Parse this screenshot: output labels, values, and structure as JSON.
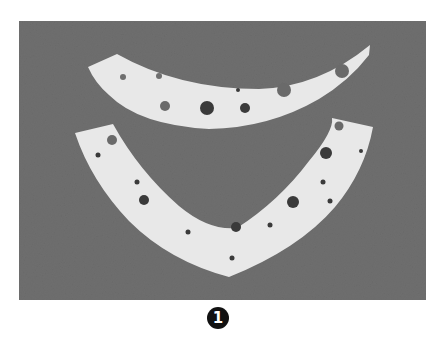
{
  "figure": {
    "label": "1",
    "colors": {
      "background": "#6f6f6f",
      "strip": "#e8e8e8",
      "hole": "#3a3a3a",
      "hole_light": "#6a6a6a",
      "label_bg": "#111111",
      "label_fg": "#ffffff"
    },
    "top_strip": {
      "holes": [
        {
          "cx": 146,
          "cy": 85,
          "r": 5,
          "tone": "light"
        },
        {
          "cx": 188,
          "cy": 87,
          "r": 7,
          "tone": "dark"
        },
        {
          "cx": 226,
          "cy": 87,
          "r": 5,
          "tone": "dark"
        },
        {
          "cx": 219,
          "cy": 69,
          "r": 2,
          "tone": "dark"
        },
        {
          "cx": 265,
          "cy": 69,
          "r": 7,
          "tone": "light"
        },
        {
          "cx": 323,
          "cy": 50,
          "r": 7,
          "tone": "light"
        }
      ]
    },
    "bottom_strip": {
      "holes": [
        {
          "cx": 93,
          "cy": 119,
          "r": 5,
          "tone": "light"
        },
        {
          "cx": 79,
          "cy": 134,
          "r": 2.5,
          "tone": "dark"
        },
        {
          "cx": 118,
          "cy": 161,
          "r": 2.5,
          "tone": "dark"
        },
        {
          "cx": 125,
          "cy": 179,
          "r": 5,
          "tone": "dark"
        },
        {
          "cx": 169,
          "cy": 211,
          "r": 2.5,
          "tone": "dark"
        },
        {
          "cx": 217,
          "cy": 206,
          "r": 5,
          "tone": "dark"
        },
        {
          "cx": 213,
          "cy": 237,
          "r": 2.5,
          "tone": "dark"
        },
        {
          "cx": 251,
          "cy": 204,
          "r": 2.5,
          "tone": "dark"
        },
        {
          "cx": 274,
          "cy": 181,
          "r": 6,
          "tone": "dark"
        },
        {
          "cx": 304,
          "cy": 161,
          "r": 2.5,
          "tone": "dark"
        },
        {
          "cx": 307,
          "cy": 132,
          "r": 6,
          "tone": "dark"
        },
        {
          "cx": 320,
          "cy": 105,
          "r": 4.5,
          "tone": "light"
        },
        {
          "cx": 342,
          "cy": 130,
          "r": 2,
          "tone": "dark"
        },
        {
          "cx": 311,
          "cy": 180,
          "r": 2.5,
          "tone": "dark"
        }
      ]
    }
  }
}
